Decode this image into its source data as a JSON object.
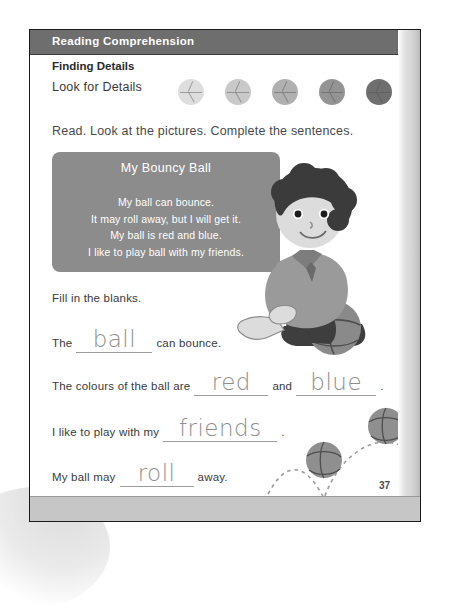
{
  "worksheet": {
    "header_title": "Reading Comprehension",
    "section_title": "Finding Details",
    "skill_label": "Look for Details",
    "instruction": "Read. Look at the pictures. Complete the sentences.",
    "page_number": "37"
  },
  "difficulty_meter": {
    "name": "difficulty-level-balls",
    "total": 5,
    "filled": 5,
    "levels": [
      {
        "index": 1,
        "color": "#dedede"
      },
      {
        "index": 2,
        "color": "#c9c9c9"
      },
      {
        "index": 3,
        "color": "#b0b0b0"
      },
      {
        "index": 4,
        "color": "#949494"
      },
      {
        "index": 5,
        "color": "#6f6f6f"
      }
    ]
  },
  "passage": {
    "title": "My Bouncy Ball",
    "lines": [
      "My ball can bounce.",
      "It may roll away, but I will get it.",
      "My ball is red and blue.",
      "I like to play ball with my friends."
    ],
    "body_text": "My ball can bounce.\nIt may roll away, but I will get it.\nMy ball is red and blue.\nI like to play ball with my friends.",
    "panel_color": "#8c8c8c",
    "text_color": "#ffffff"
  },
  "fill_in": {
    "instruction": "Fill in the blanks.",
    "questions": [
      {
        "id": "q1",
        "before": "The",
        "answer": "ball",
        "after": "can bounce.",
        "answer2": "",
        "middle": "",
        "tail": ""
      },
      {
        "id": "q2",
        "before": "The colours of the ball are",
        "answer": "red",
        "middle": "and",
        "answer2": "blue",
        "after": ".",
        "tail": "."
      },
      {
        "id": "q3",
        "before": "I like to play with my",
        "answer": "friends",
        "after": ".",
        "middle": "",
        "answer2": "",
        "tail": ""
      },
      {
        "id": "q4",
        "before": "My ball may",
        "answer": "roll",
        "after": "away.",
        "middle": "",
        "answer2": "",
        "tail": ""
      }
    ]
  },
  "illustration": {
    "subject": "boy-kneeling-with-ball",
    "hair_color": "#3b3b3b",
    "skin_color": "#d8d8d8",
    "shirt_color": "#9a9a9a",
    "pants_color": "#3e3e3e",
    "ball_color": "#8a8a8a"
  },
  "bounce_scene": {
    "name": "bouncing-ball-trajectory",
    "ball_count": 2,
    "trail_style": "dashed"
  },
  "colors": {
    "header_bar": "#6e6e6e",
    "passage_panel": "#8c8c8c",
    "blank_underline": "#9c9c9c",
    "handwriting": "#8e8e8e",
    "page_border": "#1a1a1a",
    "bottom_band": "#c6c6c6"
  }
}
